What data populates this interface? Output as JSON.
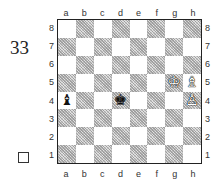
{
  "diagram": {
    "number": "33",
    "turn_indicator": "white-to-move",
    "files": [
      "a",
      "b",
      "c",
      "d",
      "e",
      "f",
      "g",
      "h"
    ],
    "ranks": [
      "8",
      "7",
      "6",
      "5",
      "4",
      "3",
      "2",
      "1"
    ],
    "colors": {
      "light_square": "#ffffff",
      "dark_square": "#c8c8c8",
      "border": "#222222"
    },
    "pieces": [
      {
        "square": "g5",
        "color": "white",
        "type": "king",
        "glyph": "♔"
      },
      {
        "square": "h5",
        "color": "white",
        "type": "bishop",
        "glyph": "♗"
      },
      {
        "square": "h4",
        "color": "white",
        "type": "pawn",
        "glyph": "♙"
      },
      {
        "square": "d4",
        "color": "black",
        "type": "king",
        "glyph": "♚"
      },
      {
        "square": "a4",
        "color": "black",
        "type": "bishop",
        "glyph": "♝"
      }
    ]
  }
}
